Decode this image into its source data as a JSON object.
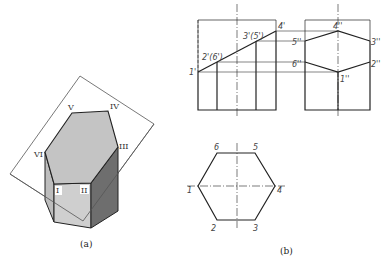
{
  "figure_a": {
    "caption": "(a)",
    "vertex_labels": {
      "I": "I",
      "II": "II",
      "III": "III",
      "IV": "IV",
      "V": "V",
      "VI": "VI"
    },
    "colors": {
      "cut_face": "#c4c4c4",
      "front_face": "#cfcfcf",
      "left_face": "#bdbdbd",
      "right_face": "#6e6e6e",
      "edge": "#222222",
      "plane": "#555555"
    }
  },
  "figure_b": {
    "caption": "(b)",
    "front_view_labels": {
      "p1": "1'",
      "p26": "2'(6')",
      "p35": "3'(5')",
      "p4": "4'"
    },
    "side_view_labels": {
      "p4": "4''",
      "p5": "5''",
      "p3": "3''",
      "p6": "6''",
      "p2": "2''",
      "p1": "1''"
    },
    "top_view_labels": {
      "p1": "1",
      "p2": "2",
      "p3": "3",
      "p4": "4",
      "p5": "5",
      "p6": "6"
    }
  }
}
